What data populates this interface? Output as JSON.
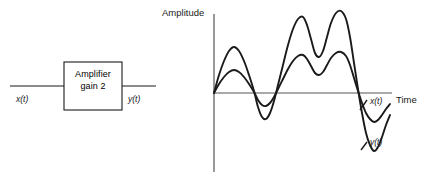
{
  "figure": {
    "block_diagram": {
      "block_label_line1": "Amplifier",
      "block_label_line2": "gain 2",
      "input_label": "x(t)",
      "output_label": "y(t)"
    },
    "plot": {
      "y_axis_label": "Amplitude",
      "x_axis_label": "Time",
      "curve_label_input": "x(t)",
      "curve_label_output": "y(t)"
    },
    "colors": {
      "stroke": "#1a1a1a",
      "axis": "#555555",
      "background": "#ffffff"
    }
  },
  "chart_data": {
    "type": "line",
    "title": "",
    "xlabel": "Time",
    "ylabel": "Amplitude",
    "grid": false,
    "legend": "inline-curve-labels",
    "axis_origin_px": [
      214,
      93
    ],
    "xlim": [
      0,
      1
    ],
    "ylim": [
      -2.2,
      2.2
    ],
    "series": [
      {
        "name": "x(t)",
        "gain": 1,
        "color": "#1a1a1a",
        "points_px": [
          [
            214,
            93
          ],
          [
            219,
            84
          ],
          [
            224,
            77
          ],
          [
            229,
            72
          ],
          [
            234,
            70
          ],
          [
            239,
            72
          ],
          [
            244,
            77
          ],
          [
            249,
            84
          ],
          [
            254,
            92
          ],
          [
            258,
            100
          ],
          [
            262,
            105
          ],
          [
            266,
            106
          ],
          [
            270,
            103
          ],
          [
            274,
            97
          ],
          [
            278,
            89
          ],
          [
            283,
            79
          ],
          [
            288,
            69
          ],
          [
            293,
            61
          ],
          [
            298,
            56
          ],
          [
            303,
            55
          ],
          [
            307,
            59
          ],
          [
            311,
            66
          ],
          [
            315,
            73
          ],
          [
            319,
            75
          ],
          [
            323,
            72
          ],
          [
            327,
            65
          ],
          [
            331,
            58
          ],
          [
            336,
            53
          ],
          [
            341,
            52
          ],
          [
            346,
            56
          ],
          [
            350,
            65
          ],
          [
            354,
            78
          ],
          [
            358,
            91
          ],
          [
            362,
            103
          ],
          [
            366,
            113
          ],
          [
            370,
            119
          ],
          [
            374,
            122
          ],
          [
            378,
            120
          ],
          [
            382,
            115
          ],
          [
            386,
            109
          ],
          [
            390,
            104
          ]
        ]
      },
      {
        "name": "y(t)",
        "gain": 2,
        "color": "#1a1a1a",
        "points_px": [
          [
            214,
            93
          ],
          [
            219,
            75
          ],
          [
            224,
            61
          ],
          [
            229,
            51
          ],
          [
            234,
            47
          ],
          [
            239,
            51
          ],
          [
            244,
            61
          ],
          [
            249,
            75
          ],
          [
            254,
            91
          ],
          [
            258,
            107
          ],
          [
            262,
            117
          ],
          [
            266,
            119
          ],
          [
            270,
            113
          ],
          [
            274,
            101
          ],
          [
            278,
            85
          ],
          [
            283,
            65
          ],
          [
            288,
            45
          ],
          [
            293,
            29
          ],
          [
            298,
            19
          ],
          [
            303,
            17
          ],
          [
            307,
            25
          ],
          [
            311,
            39
          ],
          [
            315,
            53
          ],
          [
            319,
            57
          ],
          [
            323,
            51
          ],
          [
            327,
            37
          ],
          [
            331,
            23
          ],
          [
            336,
            13
          ],
          [
            341,
            11
          ],
          [
            346,
            19
          ],
          [
            350,
            37
          ],
          [
            354,
            63
          ],
          [
            358,
            89
          ],
          [
            362,
            113
          ],
          [
            366,
            133
          ],
          [
            370,
            145
          ],
          [
            374,
            151
          ],
          [
            378,
            147
          ],
          [
            382,
            137
          ],
          [
            386,
            125
          ],
          [
            390,
            115
          ]
        ]
      }
    ],
    "annotations": [
      {
        "text": "x(t)",
        "at_px": [
          368,
          101
        ]
      },
      {
        "text": "y(t)",
        "at_px": [
          368,
          142
        ]
      },
      {
        "text": "Amplitude",
        "at_px": [
          162,
          8
        ]
      },
      {
        "text": "Time",
        "at_px": [
          394,
          94
        ]
      }
    ]
  }
}
